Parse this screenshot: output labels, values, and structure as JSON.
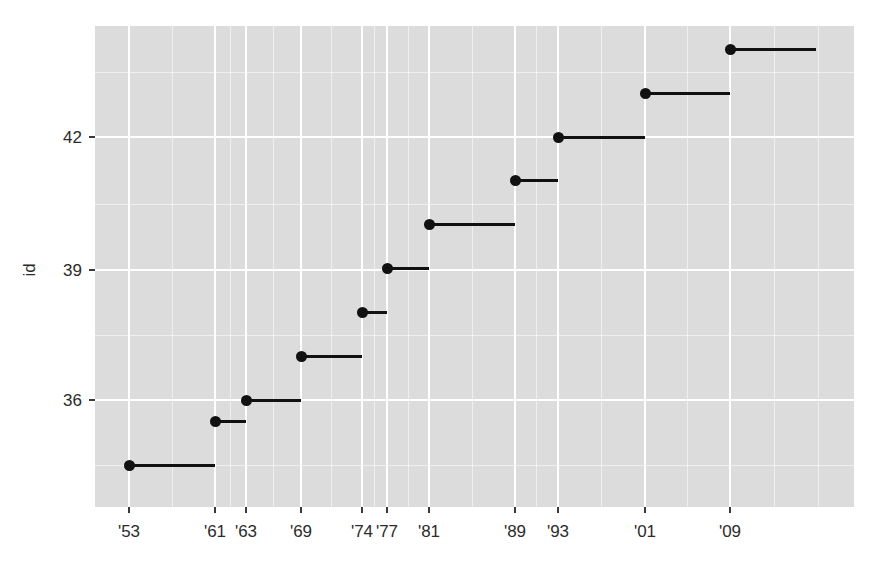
{
  "chart_data": {
    "type": "line",
    "subtype": "step",
    "title": "",
    "subtitle": "",
    "xlabel": "",
    "ylabel": "id",
    "grid": true,
    "legend": null,
    "panel_background": "#dcdcdc",
    "grid_color": "#ffffff",
    "mark_color": "#111111",
    "x_tick_labels": [
      "'53",
      "'61",
      "'63",
      "'69",
      "'74",
      "'77",
      "'81",
      "'89",
      "'93",
      "'01",
      "'09"
    ],
    "x_tick_values": [
      1953,
      1961,
      1963,
      1969,
      1974,
      1977,
      1981,
      1989,
      1993,
      2001,
      2009
    ],
    "y_tick_labels": [
      "36",
      "39",
      "42"
    ],
    "y_tick_values": [
      36,
      39,
      42
    ],
    "xlim": [
      1950,
      2017
    ],
    "ylim": [
      34,
      45
    ],
    "categories": [
      "'53",
      "'61",
      "'63",
      "'69",
      "'74",
      "'77",
      "'81",
      "'89",
      "'93",
      "'01",
      "'09"
    ],
    "values": [
      34.5,
      35.5,
      36,
      37,
      38,
      39,
      40,
      41,
      42,
      43,
      44
    ],
    "series": [
      {
        "name": "id",
        "points": [
          {
            "x": 1953,
            "label": "'53",
            "y": 34.5,
            "x_end": 1961
          },
          {
            "x": 1961,
            "label": "'61",
            "y": 35.5,
            "x_end": 1963
          },
          {
            "x": 1963,
            "label": "'63",
            "y": 36.0,
            "x_end": 1969
          },
          {
            "x": 1969,
            "label": "'69",
            "y": 37.0,
            "x_end": 1974
          },
          {
            "x": 1974,
            "label": "'74",
            "y": 38.0,
            "x_end": 1977
          },
          {
            "x": 1977,
            "label": "'77",
            "y": 39.0,
            "x_end": 1981
          },
          {
            "x": 1981,
            "label": "'81",
            "y": 40.0,
            "x_end": 1989
          },
          {
            "x": 1989,
            "label": "'89",
            "y": 41.0,
            "x_end": 1993
          },
          {
            "x": 1993,
            "label": "'93",
            "y": 42.0,
            "x_end": 2001
          },
          {
            "x": 2001,
            "label": "'01",
            "y": 43.0,
            "x_end": 2009
          },
          {
            "x": 2009,
            "label": "'09",
            "y": 44.0,
            "x_end": 2017
          }
        ]
      }
    ]
  },
  "axes": {
    "y_title": "id",
    "x_title": "",
    "y_ticks": [
      {
        "label": "36",
        "px": 400
      },
      {
        "label": "39",
        "px": 270
      },
      {
        "label": "42",
        "px": 137
      }
    ],
    "x_ticks": [
      {
        "label": "'53",
        "px": 129
      },
      {
        "label": "'61",
        "px": 215
      },
      {
        "label": "'63",
        "px": 246
      },
      {
        "label": "'69",
        "px": 301
      },
      {
        "label": "'74",
        "px": 362
      },
      {
        "label": "'77",
        "px": 387
      },
      {
        "label": "'81",
        "px": 429
      },
      {
        "label": "'89",
        "px": 515
      },
      {
        "label": "'93",
        "px": 558
      },
      {
        "label": "'01",
        "px": 645
      },
      {
        "label": "'09",
        "px": 730
      }
    ]
  },
  "panel": {
    "left": 95,
    "top": 26,
    "width": 759,
    "height": 481,
    "v_major_px": [
      129,
      215,
      246,
      301,
      362,
      387,
      429,
      515,
      558,
      645,
      730
    ],
    "v_minor_px": [
      172,
      230,
      273,
      331,
      374,
      408,
      472,
      536,
      601,
      687,
      774,
      818
    ],
    "h_major_px": [
      137,
      270,
      400
    ],
    "h_minor_px": [
      72,
      204,
      335,
      465
    ]
  }
}
